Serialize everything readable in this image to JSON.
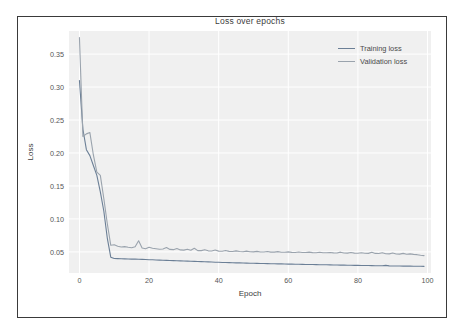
{
  "figure": {
    "title": "Loss over epochs"
  },
  "axes": {
    "xlabel": "Epoch",
    "ylabel": "Loss",
    "xticks": [
      "0",
      "20",
      "40",
      "60",
      "80",
      "100"
    ],
    "yticks": [
      "0.05",
      "0.10",
      "0.15",
      "0.20",
      "0.25",
      "0.30",
      "0.35"
    ]
  },
  "legend": {
    "entries": [
      {
        "label": "Training loss",
        "color": "#6b7f96"
      },
      {
        "label": "Validation loss",
        "color": "#9aa3ad"
      }
    ]
  },
  "colors": {
    "plot_background": "#f0f0f0",
    "grid": "#ffffff",
    "frame": "#3a3a3a",
    "training": "#6b7f96",
    "validation": "#9aa3ad",
    "tick_text": "#555555"
  },
  "chart_data": {
    "type": "line",
    "title": "Loss over epochs",
    "xlabel": "Epoch",
    "ylabel": "Loss",
    "xlim": [
      -3,
      101
    ],
    "ylim": [
      0.018,
      0.385
    ],
    "grid": true,
    "legend_position": "upper right",
    "xticks": [
      0,
      20,
      40,
      60,
      80,
      100
    ],
    "yticks": [
      0.05,
      0.1,
      0.15,
      0.2,
      0.25,
      0.3,
      0.35
    ],
    "x": [
      0,
      1,
      2,
      3,
      4,
      5,
      6,
      7,
      8,
      9,
      10,
      11,
      12,
      13,
      14,
      15,
      16,
      17,
      18,
      19,
      20,
      21,
      22,
      23,
      24,
      25,
      26,
      27,
      28,
      29,
      30,
      31,
      32,
      33,
      34,
      35,
      36,
      37,
      38,
      39,
      40,
      41,
      42,
      43,
      44,
      45,
      46,
      47,
      48,
      49,
      50,
      51,
      52,
      53,
      54,
      55,
      56,
      57,
      58,
      59,
      60,
      61,
      62,
      63,
      64,
      65,
      66,
      67,
      68,
      69,
      70,
      71,
      72,
      73,
      74,
      75,
      76,
      77,
      78,
      79,
      80,
      81,
      82,
      83,
      84,
      85,
      86,
      87,
      88,
      89,
      90,
      91,
      92,
      93,
      94,
      95,
      96,
      97,
      98,
      99
    ],
    "series": [
      {
        "name": "Training loss",
        "color": "#6b7f96",
        "values": [
          0.31,
          0.236,
          0.205,
          0.196,
          0.181,
          0.166,
          0.141,
          0.112,
          0.071,
          0.042,
          0.04,
          0.0398,
          0.0396,
          0.0394,
          0.0393,
          0.0391,
          0.039,
          0.0388,
          0.0386,
          0.0384,
          0.0382,
          0.038,
          0.0378,
          0.0376,
          0.0374,
          0.0372,
          0.037,
          0.0368,
          0.0366,
          0.0364,
          0.0362,
          0.036,
          0.0358,
          0.0356,
          0.0354,
          0.0352,
          0.035,
          0.0348,
          0.0346,
          0.0344,
          0.0342,
          0.034,
          0.0339,
          0.0337,
          0.0336,
          0.0334,
          0.0333,
          0.0331,
          0.033,
          0.0328,
          0.0327,
          0.0326,
          0.0324,
          0.0323,
          0.0322,
          0.0321,
          0.032,
          0.0319,
          0.0318,
          0.0316,
          0.0315,
          0.0314,
          0.0313,
          0.0312,
          0.0311,
          0.031,
          0.0309,
          0.0308,
          0.0307,
          0.0306,
          0.0305,
          0.0304,
          0.0303,
          0.0302,
          0.0301,
          0.03,
          0.0299,
          0.0298,
          0.0297,
          0.0296,
          0.0295,
          0.0294,
          0.0294,
          0.0293,
          0.0292,
          0.0291,
          0.029,
          0.029,
          0.0296,
          0.0288,
          0.0287,
          0.0287,
          0.0286,
          0.0285,
          0.0285,
          0.0284,
          0.0283,
          0.0283,
          0.0282,
          0.0281
        ]
      },
      {
        "name": "Validation loss",
        "color": "#9aa3ad",
        "values": [
          0.375,
          0.225,
          0.229,
          0.231,
          0.197,
          0.171,
          0.166,
          0.131,
          0.093,
          0.06,
          0.0608,
          0.0586,
          0.0575,
          0.058,
          0.057,
          0.0562,
          0.0578,
          0.0668,
          0.056,
          0.0549,
          0.057,
          0.0556,
          0.0548,
          0.054,
          0.0545,
          0.0566,
          0.0538,
          0.0534,
          0.0552,
          0.053,
          0.0527,
          0.054,
          0.0524,
          0.0556,
          0.052,
          0.0519,
          0.0534,
          0.0516,
          0.0514,
          0.0528,
          0.0512,
          0.051,
          0.052,
          0.0508,
          0.0506,
          0.0516,
          0.0505,
          0.0503,
          0.0512,
          0.0502,
          0.05,
          0.0508,
          0.0499,
          0.0498,
          0.0506,
          0.0497,
          0.0496,
          0.0504,
          0.0495,
          0.0494,
          0.05,
          0.0493,
          0.0492,
          0.0499,
          0.0491,
          0.049,
          0.0496,
          0.0489,
          0.0488,
          0.0494,
          0.0487,
          0.0486,
          0.0492,
          0.0485,
          0.0484,
          0.0496,
          0.0483,
          0.0482,
          0.049,
          0.0481,
          0.048,
          0.0488,
          0.0479,
          0.0478,
          0.0494,
          0.0477,
          0.0476,
          0.0488,
          0.0472,
          0.047,
          0.0484,
          0.0468,
          0.0466,
          0.0478,
          0.0464,
          0.047,
          0.0462,
          0.0458,
          0.045,
          0.0444
        ]
      }
    ]
  }
}
